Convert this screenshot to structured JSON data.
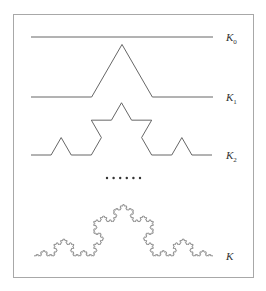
{
  "figure": {
    "frame": {
      "x": 13,
      "y": 14,
      "width": 240,
      "height": 263,
      "stroke": "#a8a8a8"
    },
    "curve_color": "#555555",
    "curves": [
      {
        "name": "K0",
        "label": "K",
        "subscript": "0",
        "level": 0,
        "x0": 31,
        "x1": 213,
        "baseline_y": 37,
        "label_x": 226,
        "label_y": 41
      },
      {
        "name": "K1",
        "label": "K",
        "subscript": "1",
        "level": 1,
        "x0": 31,
        "x1": 213,
        "baseline_y": 97,
        "label_x": 226,
        "label_y": 101
      },
      {
        "name": "K2",
        "label": "K",
        "subscript": "2",
        "level": 2,
        "x0": 31,
        "x1": 212,
        "baseline_y": 155,
        "label_x": 226,
        "label_y": 159
      },
      {
        "name": "K",
        "label": "K",
        "subscript": "",
        "level": 5,
        "x0": 34,
        "x1": 213,
        "baseline_y": 256,
        "label_x": 226,
        "label_y": 260
      }
    ],
    "ellipsis": {
      "count": 6,
      "x_start": 107,
      "spacing": 6.6,
      "y": 178,
      "radius": 1.2
    }
  }
}
